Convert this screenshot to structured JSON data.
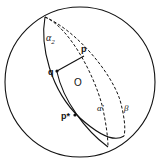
{
  "diagram": {
    "type": "sphere-with-great-circles",
    "labels": {
      "alpha2": "α",
      "alpha2_sub": "2",
      "p": "p",
      "q": "q",
      "O": "O",
      "alpha_prime": "α'",
      "beta": "β",
      "p_star": "p*"
    },
    "colors": {
      "stroke": "#111111",
      "background": "#ffffff"
    }
  }
}
